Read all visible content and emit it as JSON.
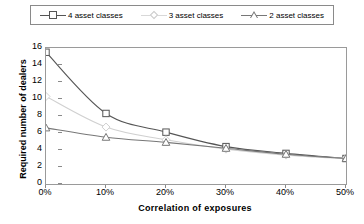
{
  "chart_data": {
    "type": "line",
    "title": "",
    "xlabel": "Correlation of exposures",
    "ylabel": "Required number of dealers",
    "x": [
      0,
      10,
      20,
      30,
      40,
      50
    ],
    "xticklabels": [
      "0%",
      "10%",
      "20%",
      "30%",
      "40%",
      "50%"
    ],
    "yticklabels": [
      "0",
      "2",
      "4",
      "6",
      "8",
      "10",
      "12",
      "14",
      "16"
    ],
    "yticks": [
      0,
      2,
      4,
      6,
      8,
      10,
      12,
      14,
      16
    ],
    "xlim": [
      0,
      50
    ],
    "ylim": [
      0,
      16
    ],
    "grid": false,
    "legend_position": "top",
    "series": [
      {
        "name": "4 asset classes",
        "marker": "square",
        "color": "#555555",
        "values": [
          15.5,
          8.3,
          6.1,
          4.4,
          3.6,
          3.0
        ]
      },
      {
        "name": "3 asset classes",
        "marker": "diamond",
        "color": "#d0d0d0",
        "values": [
          10.3,
          6.7,
          5.2,
          4.1,
          3.4,
          3.0
        ]
      },
      {
        "name": "2 asset classes",
        "marker": "triangle",
        "color": "#777777",
        "values": [
          6.6,
          5.5,
          4.9,
          4.2,
          3.5,
          3.0
        ]
      }
    ]
  },
  "legend": {
    "items": [
      {
        "label": "4 asset classes",
        "marker": "square-marker",
        "color": "#555555"
      },
      {
        "label": "3 asset classes",
        "marker": "diamond-marker",
        "color": "#d0d0d0"
      },
      {
        "label": "2 asset classes",
        "marker": "triangle-marker",
        "color": "#777777"
      }
    ]
  },
  "axes": {
    "y_title": "Required number of dealers",
    "x_title": "Correlation of exposures"
  }
}
